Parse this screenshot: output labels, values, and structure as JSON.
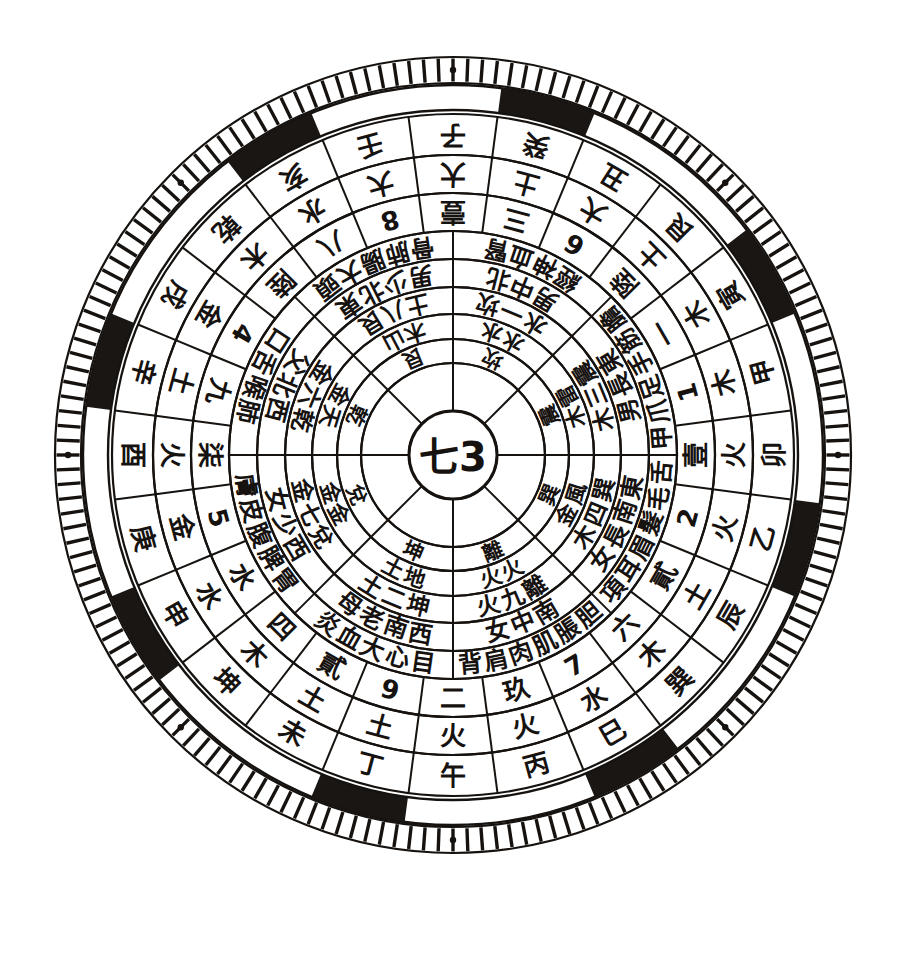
{
  "diagram": {
    "center_label": "七3",
    "colors": {
      "ink": "#16120f",
      "paper": "#ffffff",
      "band": "#1a1613"
    },
    "geometry": {
      "cx": 453,
      "cy": 455,
      "r_outer_tick": 398,
      "r_tick_inner": 372,
      "r_band_outer": 370,
      "r_band_inner": 345,
      "r_ring1_outer": 341,
      "rings": [
        341,
        300,
        262,
        224,
        196,
        168,
        141,
        116,
        92,
        67,
        44
      ]
    }
  },
  "rings": [
    {
      "name": "earthly-branches-ring",
      "index": 1,
      "r_out": 341,
      "r_in": 300,
      "sectors": 24,
      "offset_deg": -7.5,
      "labels": [
        "子",
        "癸",
        "丑",
        "艮",
        "寅",
        "甲",
        "卯",
        "乙",
        "辰",
        "巽",
        "巳",
        "丙",
        "午",
        "丁",
        "未",
        "坤",
        "申",
        "庚",
        "酉",
        "辛",
        "戌",
        "乾",
        "亥",
        "壬"
      ]
    },
    {
      "name": "five-elements-ring",
      "index": 2,
      "r_out": 300,
      "r_in": 262,
      "sectors": 24,
      "offset_deg": -7.5,
      "labels": [
        "大",
        "土",
        "大",
        "土",
        "木",
        "木",
        "火",
        "火",
        "土",
        "木",
        "水",
        "火",
        "火",
        "土",
        "土",
        "木",
        "水",
        "金",
        "火",
        "土",
        "金",
        "木",
        "水",
        "大"
      ]
    },
    {
      "name": "arabic-chinese-number-ring",
      "index": 3,
      "r_out": 262,
      "r_in": 224,
      "sectors": 24,
      "offset_deg": -7.5,
      "labels": [
        "壹",
        "三",
        "6",
        "陸",
        "一",
        "1",
        "壹",
        "2",
        "貳",
        "六",
        "7",
        "玖",
        "二",
        "9",
        "貳",
        "四",
        "水",
        "5",
        "柒",
        "九",
        "4",
        "陸",
        "八",
        "8"
      ]
    },
    {
      "name": "organ-ring",
      "index": 4,
      "r_out": 224,
      "r_in": 196,
      "sectors": 8,
      "offset_deg": 0,
      "labels": [
        "腎血神經",
        "膽筋手足爪甲",
        "舌毛髮眉耳項",
        "胆脹肌肉肩背",
        "目心大血炎",
        "胃脾腹皮膚",
        "肺喉舌口",
        "頭大腸肺骨"
      ]
    },
    {
      "name": "direction-gender-ring",
      "index": 5,
      "r_out": 196,
      "r_in": 168,
      "sectors": 8,
      "offset_deg": 0,
      "labels": [
        "北中男",
        "東長男",
        "東南長女",
        "南中女",
        "西南老母",
        "西少女",
        "西北父",
        "東北少男"
      ]
    },
    {
      "name": "trigram-number-element-ring",
      "index": 6,
      "r_out": 168,
      "r_in": 141,
      "sectors": 8,
      "offset_deg": 0,
      "labels": [
        "坎一水",
        "震三木",
        "巽四木",
        "離九火",
        "坤二土",
        "兌七金",
        "乾六金",
        "艮八土"
      ]
    },
    {
      "name": "nature-element-ring",
      "index": 7,
      "r_out": 141,
      "r_in": 116,
      "sectors": 8,
      "offset_deg": 0,
      "labels": [
        "水水",
        "雷木",
        "風金",
        "火火",
        "地土",
        "金金",
        "天金",
        "山木"
      ]
    },
    {
      "name": "trigram-name-ring",
      "index": 8,
      "r_out": 116,
      "r_in": 92,
      "sectors": 8,
      "offset_deg": 0,
      "labels": [
        "坎",
        "震",
        "巽",
        "離",
        "坤",
        "兌",
        "乾",
        "艮"
      ]
    },
    {
      "name": "inner-blank-ring",
      "index": 9,
      "r_out": 92,
      "r_in": 44,
      "sectors": 8,
      "offset_deg": 0,
      "labels": [
        "",
        "",
        "",
        "",
        "",
        "",
        "",
        ""
      ]
    }
  ],
  "outer_band": {
    "name": "alternating-black-white-band",
    "segments": 24,
    "black_indices": [
      1,
      4,
      7,
      10,
      13,
      16,
      19,
      22
    ],
    "dot_marker_count": 8
  },
  "tick_ring": {
    "name": "fine-graduation-ring",
    "tick_count": 168
  }
}
